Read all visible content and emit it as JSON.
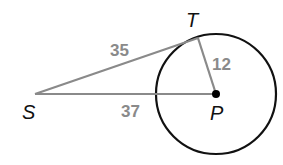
{
  "diagram": {
    "type": "geometry-tangent-circle",
    "colors": {
      "circle": "#111111",
      "segments": "#8a8a8a",
      "center_dot": "#000000",
      "point_labels": "#111111",
      "length_labels": "#8a8a8a"
    },
    "points": {
      "S": {
        "label": "S",
        "x": 35,
        "y": 94
      },
      "T": {
        "label": "T",
        "x": 198,
        "y": 38
      },
      "P": {
        "label": "P",
        "x": 216,
        "y": 94
      }
    },
    "circle": {
      "center": "P",
      "cx": 216,
      "cy": 94,
      "r": 60
    },
    "segments": [
      {
        "from": "S",
        "to": "T",
        "length_label": "35"
      },
      {
        "from": "S",
        "to": "P",
        "length_label": "37"
      },
      {
        "from": "T",
        "to": "P",
        "length_label": "12"
      }
    ]
  }
}
